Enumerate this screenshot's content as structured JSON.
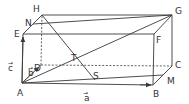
{
  "figure": {
    "type": "rectangular parallelepiped (box) with vectors",
    "vertices": {
      "A": {
        "label": "A",
        "x": 22,
        "y": 83
      },
      "B": {
        "label": "B",
        "x": 153,
        "y": 85
      },
      "C": {
        "label": "C",
        "x": 172,
        "y": 66
      },
      "D": {
        "label": "D",
        "x": 41,
        "y": 65
      },
      "E": {
        "label": "E",
        "x": 23,
        "y": 34
      },
      "F": {
        "label": "F",
        "x": 154,
        "y": 34
      },
      "G": {
        "label": "G",
        "x": 172,
        "y": 15
      },
      "H": {
        "label": "H",
        "x": 42,
        "y": 15
      }
    },
    "points": {
      "N": {
        "label": "N"
      },
      "M": {
        "label": "M"
      },
      "T": {
        "label": "T"
      },
      "S": {
        "label": "S"
      }
    },
    "vectors": {
      "a": {
        "label": "a",
        "arrow": "→",
        "from": "A",
        "to": "B"
      },
      "b": {
        "label": "b",
        "arrow": "→",
        "from": "A",
        "to": "D"
      },
      "c": {
        "label": "c",
        "arrow": "→",
        "from": "A",
        "to": "E"
      }
    },
    "solid_edges": [
      "AB",
      "AE",
      "EF",
      "EH",
      "HG",
      "FG",
      "FB",
      "BC",
      "CG"
    ],
    "hidden_edges": [
      "AD",
      "DH",
      "DC"
    ],
    "segments": [
      "HM",
      "NG",
      "AG",
      "AM"
    ]
  }
}
